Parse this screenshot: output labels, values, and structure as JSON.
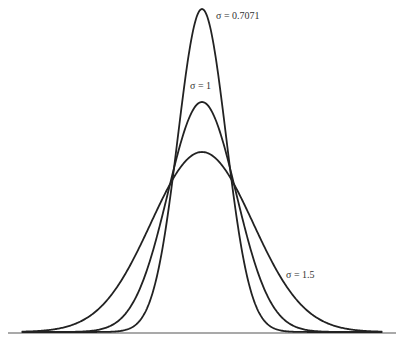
{
  "chart_data": {
    "type": "line",
    "title": "",
    "xlabel": "",
    "ylabel": "",
    "grid": false,
    "legend": "inline labels",
    "x_range": [
      -5.3,
      5.3
    ],
    "series": [
      {
        "name": "σ = 0.7071",
        "sigma": 0.7071,
        "mean": 0
      },
      {
        "name": "σ = 1",
        "sigma": 1,
        "mean": 0
      },
      {
        "name": "σ = 1.5",
        "sigma": 1.5,
        "mean": 0
      }
    ],
    "labels": [
      {
        "text": "σ = 0.7071",
        "x": 216,
        "y": 18
      },
      {
        "text": "σ = 1",
        "x": 190,
        "y": 88
      },
      {
        "text": "σ = 1.5",
        "x": 286,
        "y": 277
      }
    ]
  },
  "geometry": {
    "center_x": 202,
    "baseline_y": 332,
    "px_per_unit": 34,
    "peak_heights": [
      323,
      230,
      180
    ],
    "axis": {
      "x1": 8,
      "x2": 396,
      "y": 333
    },
    "stroke": "#222222"
  }
}
